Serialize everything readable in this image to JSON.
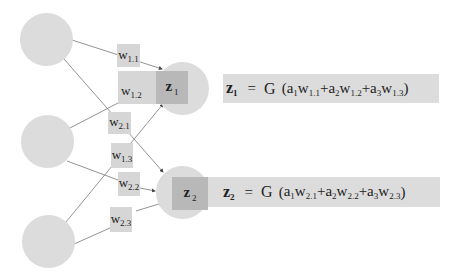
{
  "diagram": {
    "title": "",
    "colors": {
      "input_node": "#dcdcdc",
      "output_node": "#dcdcdc",
      "weight_box": "#d6d6d6",
      "output_square": "#b8b8b8",
      "equation_box": "#dcdcdc",
      "edge": "#666666"
    },
    "inputs": [
      {
        "id": "a1",
        "label": ""
      },
      {
        "id": "a2",
        "label": ""
      },
      {
        "id": "a3",
        "label": ""
      }
    ],
    "outputs": [
      {
        "id": "z1",
        "base": "z",
        "sub": "1"
      },
      {
        "id": "z2",
        "base": "z",
        "sub": "2"
      }
    ],
    "weights": [
      {
        "base": "w",
        "sub": "1.1"
      },
      {
        "base": "w",
        "sub": "1.2"
      },
      {
        "base": "w",
        "sub": "2.1"
      },
      {
        "base": "w",
        "sub": "1.3"
      },
      {
        "base": "w",
        "sub": "2.2"
      },
      {
        "base": "w",
        "sub": "2.3"
      }
    ],
    "equations": [
      {
        "lhs": "z",
        "lhs_sub": "1",
        "eq": "=",
        "fn": "G",
        "open": "(",
        "close": ")",
        "terms": [
          {
            "a": "a",
            "a_sub": "1",
            "w": "w",
            "w_sub": "1.1",
            "op": "+"
          },
          {
            "a": "a",
            "a_sub": "2",
            "w": "w",
            "w_sub": "1.2",
            "op": "+"
          },
          {
            "a": "a",
            "a_sub": "3",
            "w": "w",
            "w_sub": "1.3",
            "op": ""
          }
        ]
      },
      {
        "lhs": "z",
        "lhs_sub": "2",
        "eq": "=",
        "fn": "G",
        "open": "(",
        "close": ")",
        "terms": [
          {
            "a": "a",
            "a_sub": "1",
            "w": "w",
            "w_sub": "2.1",
            "op": "+"
          },
          {
            "a": "a",
            "a_sub": "2",
            "w": "w",
            "w_sub": "2.2",
            "op": "+"
          },
          {
            "a": "a",
            "a_sub": "3",
            "w": "w",
            "w_sub": "2.3",
            "op": ""
          }
        ]
      }
    ]
  }
}
